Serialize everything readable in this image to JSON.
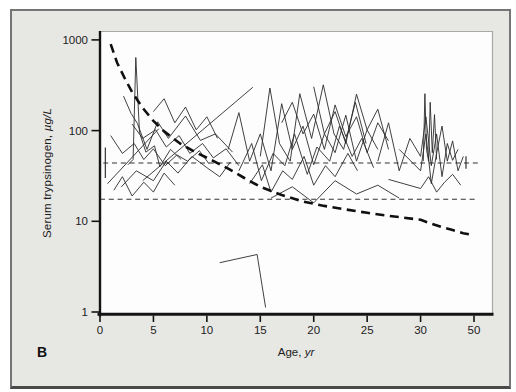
{
  "figure": {
    "panel_label": "B",
    "colors": {
      "page_bg": "#ffffff",
      "panel_bg": "#e7e7e4",
      "panel_border": "#757575",
      "plot_bg": "#fdfdfd",
      "plot_outline": "#a8a8a8",
      "axis": "#141414",
      "series_line": "#2b2b2b",
      "trend_curve": "#101010",
      "reference_line": "#333333",
      "text": "#1c1c1c"
    }
  },
  "chart_data": {
    "type": "line",
    "title": "",
    "xlabel": "Age, yr",
    "xlabel_text": "Age,",
    "xlabel_unit": "yr",
    "ylabel": "Serum trypsinogen, µg/L",
    "ylabel_text": "Serum trypsinogen,",
    "ylabel_unit": "µg/L",
    "y_scale": "log",
    "ylim": [
      1,
      1000
    ],
    "y_ticks": [
      1000,
      100,
      10,
      1
    ],
    "x_ticks": [
      0,
      5,
      10,
      15,
      20,
      25,
      30,
      50
    ],
    "x_axis_note": "x axis compressed after 30: the 30-to-50 span equals one 5-yr tick interval",
    "legend": "none",
    "grid": "off",
    "reference_lines": [
      {
        "name": "upper-dashed-reference",
        "value": 44,
        "style": "thin-dashed",
        "x_start": 0.3,
        "x_end": 51.5,
        "markers": [
          {
            "x": 0.5,
            "value_low": 30,
            "value_high": 65
          },
          {
            "x": 47,
            "value_low": 38,
            "value_high": 52
          }
        ]
      },
      {
        "name": "lower-dashed-reference",
        "value": 17.5,
        "style": "thin-dashed",
        "x_start": 0,
        "x_end": 51.5,
        "markers": []
      }
    ],
    "trend_curve": {
      "name": "heavy-dashed-trend-curve",
      "style": "heavy-dashed",
      "points": [
        [
          1,
          900
        ],
        [
          1.6,
          560
        ],
        [
          2.3,
          380
        ],
        [
          3,
          265
        ],
        [
          4,
          178
        ],
        [
          5,
          128
        ],
        [
          6,
          98
        ],
        [
          7.5,
          72
        ],
        [
          9,
          57
        ],
        [
          10.5,
          47
        ],
        [
          12,
          38
        ],
        [
          13.5,
          30
        ],
        [
          15,
          24
        ],
        [
          17,
          19.5
        ],
        [
          19,
          16.5
        ],
        [
          21,
          14.8
        ],
        [
          23,
          13.5
        ],
        [
          25,
          12.4
        ],
        [
          27,
          11.5
        ],
        [
          30,
          10.4
        ],
        [
          34,
          9.4
        ],
        [
          38,
          8.6
        ],
        [
          42,
          8
        ],
        [
          46,
          7.4
        ],
        [
          50,
          7
        ]
      ]
    },
    "series": [
      {
        "name": "patient-line-1",
        "points": [
          [
            2.6,
            42
          ],
          [
            3.1,
            48
          ],
          [
            3.35,
            640
          ],
          [
            3.7,
            95
          ],
          [
            4.3,
            58
          ],
          [
            5.1,
            68
          ],
          [
            5.6,
            40
          ],
          [
            6.6,
            62
          ],
          [
            7.6,
            48
          ]
        ]
      },
      {
        "name": "patient-line-2",
        "points": [
          [
            2.2,
            240
          ],
          [
            2.9,
            155
          ],
          [
            3.5,
            120
          ],
          [
            4.4,
            62
          ],
          [
            5.4,
            125
          ],
          [
            6.4,
            82
          ],
          [
            8,
            145
          ],
          [
            9.4,
            78
          ],
          [
            10.8,
            92
          ],
          [
            12.4,
            58
          ]
        ]
      },
      {
        "name": "patient-line-3",
        "points": [
          [
            0.7,
            26
          ],
          [
            5.5,
            105
          ]
        ]
      },
      {
        "name": "patient-line-4",
        "points": [
          [
            4.0,
            28
          ],
          [
            14.3,
            300
          ]
        ]
      },
      {
        "name": "patient-line-5",
        "points": [
          [
            1,
            88
          ],
          [
            2.1,
            56
          ],
          [
            3.2,
            72
          ],
          [
            4.1,
            48
          ],
          [
            5,
            63
          ],
          [
            6.1,
            41
          ],
          [
            7.2,
            54
          ],
          [
            8.2,
            46
          ],
          [
            9.3,
            60
          ],
          [
            10.2,
            43
          ]
        ]
      },
      {
        "name": "patient-line-6",
        "points": [
          [
            2,
            24
          ],
          [
            3.4,
            36
          ],
          [
            5,
            28
          ],
          [
            6.2,
            46
          ],
          [
            7.3,
            34
          ],
          [
            8.6,
            52
          ],
          [
            10,
            39
          ],
          [
            11.2,
            31
          ],
          [
            12.2,
            45
          ]
        ]
      },
      {
        "name": "patient-line-7",
        "points": [
          [
            3,
            118
          ],
          [
            4,
            82
          ],
          [
            5.2,
            102
          ],
          [
            6.2,
            66
          ],
          [
            7.4,
            88
          ],
          [
            8.4,
            56
          ],
          [
            9.6,
            72
          ],
          [
            10.6,
            50
          ],
          [
            11.8,
            63
          ],
          [
            13,
            41
          ]
        ]
      },
      {
        "name": "patient-line-8",
        "points": [
          [
            12,
            62
          ],
          [
            13,
            158
          ],
          [
            14,
            46
          ],
          [
            15,
            92
          ],
          [
            16,
            36
          ],
          [
            17,
            198
          ],
          [
            18,
            62
          ],
          [
            19,
            112
          ],
          [
            20,
            42
          ],
          [
            21,
            92
          ],
          [
            22,
            57
          ],
          [
            23,
            148
          ],
          [
            24,
            46
          ],
          [
            25,
            102
          ],
          [
            26,
            62
          ]
        ]
      },
      {
        "name": "patient-line-9",
        "points": [
          [
            13,
            36
          ],
          [
            14.2,
            72
          ],
          [
            15.1,
            28
          ],
          [
            16.2,
            56
          ],
          [
            17.3,
            41
          ],
          [
            18.2,
            92
          ],
          [
            19.4,
            33
          ],
          [
            20.3,
            66
          ],
          [
            21.5,
            46
          ],
          [
            22.4,
            112
          ],
          [
            23.6,
            52
          ],
          [
            24.5,
            82
          ],
          [
            25.6,
            39
          ]
        ]
      },
      {
        "name": "patient-line-10",
        "points": [
          [
            15,
            52
          ],
          [
            15.9,
            295
          ],
          [
            16.8,
            72
          ],
          [
            17.8,
            46
          ],
          [
            18.7,
            255
          ],
          [
            19.8,
            82
          ],
          [
            20.9,
            320
          ],
          [
            21.9,
            92
          ],
          [
            22.8,
            62
          ],
          [
            23.9,
            205
          ],
          [
            24.9,
            72
          ]
        ]
      },
      {
        "name": "patient-line-11",
        "points": [
          [
            14,
            26
          ],
          [
            15.2,
            42
          ],
          [
            16,
            21
          ],
          [
            17.1,
            36
          ],
          [
            18,
            29
          ],
          [
            19.1,
            52
          ],
          [
            20,
            25
          ],
          [
            21.1,
            41
          ],
          [
            22,
            31
          ],
          [
            23.2,
            56
          ],
          [
            24.1,
            36
          ]
        ]
      },
      {
        "name": "patient-line-12",
        "points": [
          [
            11.2,
            3.5
          ],
          [
            14.7,
            4.3
          ],
          [
            15.5,
            1.12
          ]
        ]
      },
      {
        "name": "patient-line-13",
        "points": [
          [
            17,
            122
          ],
          [
            18,
            205
          ],
          [
            19,
            92
          ],
          [
            20,
            152
          ],
          [
            21,
            62
          ],
          [
            22,
            192
          ],
          [
            23,
            86
          ],
          [
            24,
            142
          ],
          [
            25,
            57
          ],
          [
            26,
            122
          ],
          [
            27,
            77
          ]
        ]
      },
      {
        "name": "patient-line-14",
        "points": [
          [
            26,
            46
          ],
          [
            27,
            122
          ],
          [
            28,
            36
          ],
          [
            29,
            82
          ],
          [
            30,
            52
          ],
          [
            32,
            142
          ],
          [
            34,
            41
          ],
          [
            36,
            92
          ],
          [
            38,
            31
          ],
          [
            40,
            72
          ],
          [
            42,
            47
          ],
          [
            44,
            62
          ]
        ]
      },
      {
        "name": "patient-line-15",
        "points": [
          [
            28,
            62
          ],
          [
            30,
            36
          ],
          [
            32,
            92
          ],
          [
            34,
            26
          ],
          [
            36,
            56
          ],
          [
            38,
            112
          ],
          [
            40,
            46
          ],
          [
            42,
            77
          ],
          [
            44,
            36
          ],
          [
            46,
            52
          ]
        ]
      },
      {
        "name": "patient-line-16",
        "points": [
          [
            27,
            29
          ],
          [
            30,
            23
          ],
          [
            33,
            31
          ],
          [
            36,
            21
          ],
          [
            39,
            27
          ],
          [
            42,
            33
          ],
          [
            45,
            25
          ]
        ]
      },
      {
        "name": "patient-line-17",
        "points": [
          [
            20,
            305
          ],
          [
            21,
            92
          ],
          [
            22,
            162
          ],
          [
            23,
            72
          ],
          [
            24,
            252
          ],
          [
            25,
            102
          ],
          [
            26,
            172
          ],
          [
            27,
            62
          ]
        ]
      },
      {
        "name": "patient-line-18",
        "points": [
          [
            16,
            18
          ],
          [
            18,
            24
          ],
          [
            20,
            16
          ],
          [
            22,
            28
          ],
          [
            24,
            20
          ],
          [
            26,
            25
          ],
          [
            28,
            18
          ]
        ]
      },
      {
        "name": "patient-line-19",
        "points": [
          [
            5,
            162
          ],
          [
            6,
            225
          ],
          [
            7,
            122
          ],
          [
            8,
            182
          ],
          [
            9,
            102
          ],
          [
            10,
            142
          ],
          [
            11,
            82
          ]
        ]
      },
      {
        "name": "patient-line-20",
        "points": [
          [
            1.3,
            22
          ],
          [
            2.1,
            31
          ],
          [
            3,
            19
          ],
          [
            4.1,
            27
          ],
          [
            5,
            21
          ],
          [
            6,
            34
          ],
          [
            7,
            25
          ]
        ]
      },
      {
        "name": "patient-line-21",
        "points": [
          [
            31,
            46
          ],
          [
            31.6,
            255
          ],
          [
            32.2,
            62
          ],
          [
            33,
            46
          ],
          [
            33.6,
            205
          ],
          [
            34.4,
            57
          ],
          [
            35.2,
            150
          ],
          [
            36,
            48
          ]
        ]
      }
    ]
  }
}
